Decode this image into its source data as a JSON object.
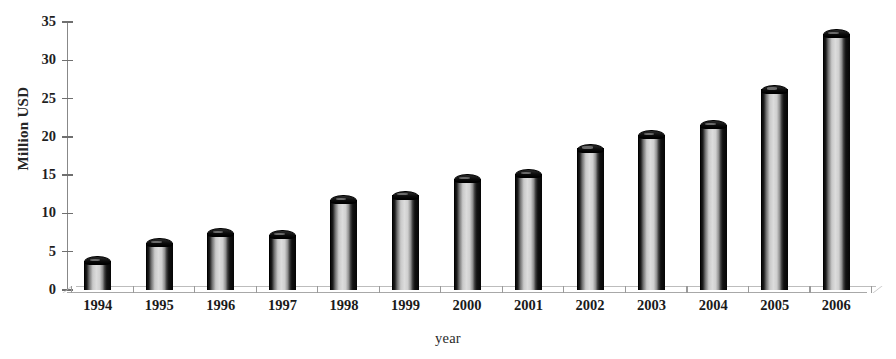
{
  "chart_data": {
    "type": "bar",
    "title": "",
    "xlabel": "year",
    "ylabel": "Million USD",
    "categories": [
      "1994",
      "1995",
      "1996",
      "1997",
      "1998",
      "1999",
      "2000",
      "2001",
      "2002",
      "2003",
      "2004",
      "2005",
      "2006"
    ],
    "values": [
      3.8,
      6.2,
      7.5,
      7.2,
      11.8,
      12.4,
      14.5,
      15.2,
      18.5,
      20.3,
      21.6,
      26.2,
      33.5
    ],
    "ylim": [
      0,
      35
    ],
    "ytick_labels": [
      "0",
      "5",
      "10",
      "15",
      "20",
      "25",
      "30",
      "35"
    ],
    "ytick_values": [
      0,
      5,
      10,
      15,
      20,
      25,
      30,
      35
    ],
    "grid": false,
    "legend": "none",
    "style": "3d-column",
    "bar_color": "#c9c9c9",
    "bar_edge_color": "#000000",
    "axis_color": "#8a8a8a",
    "background": "#ffffff"
  }
}
